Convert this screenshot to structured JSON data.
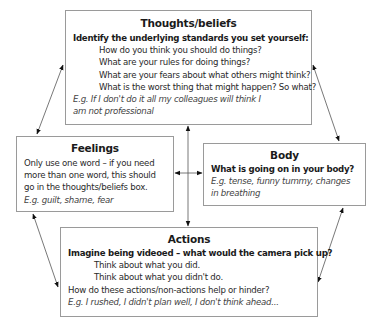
{
  "thoughts": {
    "title": "Thoughts/beliefs",
    "subtitle": "Identify the underlying standards you set yourself:",
    "questions": [
      "How do you think you should do things?",
      "What are your rules for doing things?",
      "What are your fears about what others might think?",
      "What is the worst thing that might happen? So what?"
    ],
    "example_lines": [
      "E.g. If I don't do it all my colleagues will think I",
      "am not professional"
    ]
  },
  "feelings": {
    "title": "Feelings",
    "text_lines": [
      "Only use one word – if you need",
      "more than one word, this should",
      "go in the thoughts/beliefs box."
    ],
    "example": "E.g. guilt, shame, fear"
  },
  "body": {
    "title": "Body",
    "subtitle": "What is going on in your body?",
    "example_lines": [
      "E.g. tense, funny tummy, changes",
      "in breathing"
    ]
  },
  "actions": {
    "title": "Actions",
    "subtitle": "Imagine being videoed – what would the camera pick up?",
    "prompts": [
      "Think about what you did.",
      "Think about what you didn't do."
    ],
    "question": "How do these actions/non-actions help or hinder?",
    "example": "E.g. I rushed, I didn't plan well, I don't think ahead..."
  }
}
